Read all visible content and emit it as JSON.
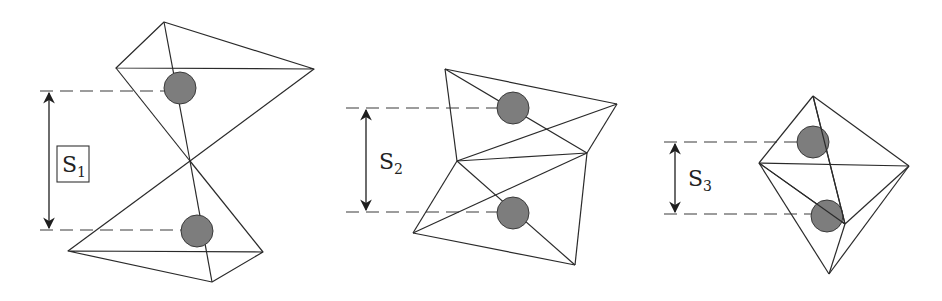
{
  "figures": [
    {
      "id": "corner-sharing",
      "label_main": "S",
      "label_sub": "1",
      "label_boxed": true,
      "separation_label": "S1",
      "description": "Two tetrahedra sharing a single corner (vertex)"
    },
    {
      "id": "edge-sharing",
      "label_main": "S",
      "label_sub": "2",
      "label_boxed": false,
      "separation_label": "S2",
      "description": "Two tetrahedra sharing an edge"
    },
    {
      "id": "face-sharing",
      "label_main": "S",
      "label_sub": "3",
      "label_boxed": false,
      "separation_label": "S3",
      "description": "Two tetrahedra sharing a face"
    }
  ],
  "colors": {
    "edge": "#2a2a2a",
    "ball_fill": "#7d7d7d",
    "background": "#ffffff"
  }
}
